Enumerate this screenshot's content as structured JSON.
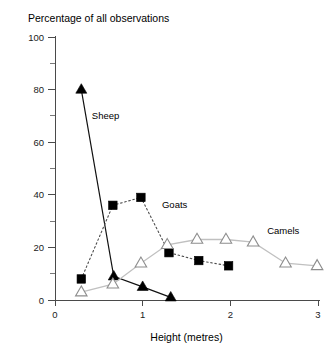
{
  "chart_data": {
    "type": "line",
    "title": "Percentage of all observations",
    "xlabel": "Height (metres)",
    "ylabel": "",
    "xlim": [
      0,
      3
    ],
    "ylim": [
      0,
      100
    ],
    "xticks": [
      "0",
      "1",
      "2",
      "3"
    ],
    "xtick_values": [
      0,
      1,
      2,
      3
    ],
    "yticks": [
      "0",
      "20",
      "40",
      "60",
      "80",
      "100"
    ],
    "ytick_values": [
      0,
      20,
      40,
      60,
      80,
      100
    ],
    "yticks_minor": [
      10,
      30,
      50,
      70,
      90
    ],
    "grid": false,
    "legend": "inline-annotations",
    "series": [
      {
        "name": "Sheep",
        "marker": "filled-triangle",
        "line_style": "solid",
        "color": "#000000",
        "label_x": 0.42,
        "label_y": 69,
        "points": [
          {
            "x": 0.3,
            "y": 80
          },
          {
            "x": 0.67,
            "y": 9
          },
          {
            "x": 1.0,
            "y": 5
          },
          {
            "x": 1.32,
            "y": 1
          }
        ]
      },
      {
        "name": "Goats",
        "marker": "filled-square",
        "line_style": "dotted",
        "color": "#000000",
        "label_x": 1.22,
        "label_y": 35,
        "points": [
          {
            "x": 0.3,
            "y": 8
          },
          {
            "x": 0.66,
            "y": 36
          },
          {
            "x": 0.98,
            "y": 39
          },
          {
            "x": 1.3,
            "y": 18
          },
          {
            "x": 1.64,
            "y": 15
          },
          {
            "x": 1.98,
            "y": 13
          }
        ]
      },
      {
        "name": "Camels",
        "marker": "open-triangle",
        "line_style": "solid-light",
        "color": "#9a9a9a",
        "label_x": 2.42,
        "label_y": 25,
        "points": [
          {
            "x": 0.3,
            "y": 3
          },
          {
            "x": 0.66,
            "y": 6
          },
          {
            "x": 0.98,
            "y": 14
          },
          {
            "x": 1.28,
            "y": 21
          },
          {
            "x": 1.62,
            "y": 23
          },
          {
            "x": 1.95,
            "y": 23
          },
          {
            "x": 2.26,
            "y": 22
          },
          {
            "x": 2.63,
            "y": 14
          },
          {
            "x": 2.99,
            "y": 13
          }
        ]
      }
    ]
  }
}
